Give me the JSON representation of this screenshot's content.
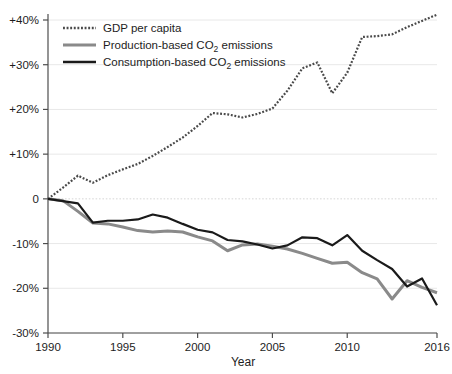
{
  "chart_data": {
    "type": "line",
    "title": "",
    "xlabel": "Year",
    "ylabel": "",
    "xlim": [
      1990,
      2016
    ],
    "ylim": [
      -30,
      40
    ],
    "grid": true,
    "grid_axis": "y",
    "legend_position": "top-left",
    "x": [
      1990,
      1991,
      1992,
      1993,
      1994,
      1995,
      1996,
      1997,
      1998,
      1999,
      2000,
      2001,
      2002,
      2003,
      2004,
      2005,
      2006,
      2007,
      2008,
      2009,
      2010,
      2011,
      2012,
      2013,
      2014,
      2015,
      2016
    ],
    "xticks": [
      1990,
      1995,
      2000,
      2005,
      2010,
      2016
    ],
    "xtick_labels": [
      "1990",
      "1995",
      "2000",
      "2005",
      "2010",
      "2016"
    ],
    "yticks": [
      40,
      30,
      20,
      10,
      0,
      -10,
      -20,
      -30
    ],
    "ytick_labels": [
      "+40%",
      "+30%",
      "+20%",
      "+10%",
      "0",
      "-10%",
      "-20%",
      "-30%"
    ],
    "series": [
      {
        "name": "GDP per capita",
        "key": "gdp",
        "color": "#4a4a4a",
        "style": "dotted",
        "width": 2.2,
        "values": [
          0.0,
          2.4,
          4.3,
          5.2,
          3.5,
          5.2,
          6.5,
          7.7,
          8.3,
          10.6,
          13.1,
          15.8,
          18.0,
          19.2,
          18.6,
          18.0,
          19.2,
          20.2,
          24.0,
          27.5,
          30.5,
          23.5,
          27.0,
          31.4,
          36.2,
          36.6,
          37.8
        ]
      },
      {
        "name": "Production-based CO2 emissions",
        "key": "production",
        "color": "#8a8a8a",
        "style": "solid",
        "width": 3.0,
        "values": [
          0.0,
          -0.3,
          -3.0,
          -5.3,
          -5.2,
          -5.6,
          -6.7,
          -7.3,
          -7.3,
          -5.9,
          -6.2,
          -7.6,
          -8.7,
          -9.9,
          -10.3,
          -11.6,
          -10.6,
          -11.0,
          -12.2,
          -13.5,
          -14.4,
          -13.1,
          -15.8,
          -16.5,
          -18.4,
          -22.5,
          -16.6
        ]
      },
      {
        "name": "Consumption-based CO2 emissions",
        "key": "consumption",
        "color": "#1a1a1a",
        "style": "solid",
        "width": 2.2,
        "values": [
          0.0,
          -0.4,
          -0.8,
          -5.3,
          -4.8,
          -4.8,
          -4.5,
          -3.4,
          -4.1,
          -4.2,
          -6.8,
          -6.4,
          -9.2,
          -9.5,
          -10.1,
          -10.6,
          -11.0,
          -10.2,
          -8.5,
          -8.6,
          -8.8,
          -10.3,
          -8.0,
          -11.5,
          -13.6,
          -15.6,
          -19.5
        ]
      }
    ],
    "series_values_extended": {
      "gdp": [
        0.0,
        2.4,
        4.3,
        5.2,
        3.5,
        5.2,
        6.5,
        7.7,
        8.3,
        10.6,
        13.1,
        15.8,
        18.0,
        19.2,
        18.6,
        18.0,
        19.2,
        20.2,
        24.0,
        27.5,
        30.5,
        23.5,
        27.0,
        31.4,
        36.2,
        36.6,
        37.8,
        39.4,
        41.2
      ],
      "production": [
        0.0,
        -0.3,
        -3.0,
        -5.3,
        -5.2,
        -5.6,
        -6.7,
        -7.3,
        -7.3,
        -7.2,
        -8.2,
        -9.4,
        -11.6,
        -10.3,
        -10.0,
        -10.6,
        -11.4,
        -12.2,
        -13.4,
        -14.4,
        -14.3,
        -16.4,
        -17.8,
        -22.5,
        -18.3,
        -19.8,
        -20.1,
        -22.2,
        -22.4,
        -21.2
      ],
      "consumption": [
        0.0,
        -0.4,
        -0.8,
        -5.3,
        -4.8,
        -4.8,
        -4.5,
        -3.4,
        -4.1,
        -5.6,
        -6.8,
        -7.5,
        -9.2,
        -9.5,
        -10.1,
        -11.1,
        -10.3,
        -8.5,
        -8.6,
        -8.8,
        -10.3,
        -8.0,
        -11.5,
        -13.6,
        -15.6,
        -19.5,
        -17.7,
        -15.5,
        -16.0,
        -20.2
      ]
    },
    "data_points": {
      "gdp": [
        {
          "year": 1990,
          "value": 0.0
        },
        {
          "year": 1991,
          "value": 2.5
        },
        {
          "year": 1992,
          "value": 5.2
        },
        {
          "year": 1993,
          "value": 3.6
        },
        {
          "year": 1994,
          "value": 5.3
        },
        {
          "year": 1995,
          "value": 6.6
        },
        {
          "year": 1996,
          "value": 7.8
        },
        {
          "year": 1997,
          "value": 9.6
        },
        {
          "year": 1998,
          "value": 11.6
        },
        {
          "year": 1999,
          "value": 13.7
        },
        {
          "year": 2000,
          "value": 16.3
        },
        {
          "year": 2001,
          "value": 19.2
        },
        {
          "year": 2002,
          "value": 18.9
        },
        {
          "year": 2003,
          "value": 18.2
        },
        {
          "year": 2004,
          "value": 19.0
        },
        {
          "year": 2005,
          "value": 20.2
        },
        {
          "year": 2006,
          "value": 24.2
        },
        {
          "year": 2007,
          "value": 29.2
        },
        {
          "year": 2008,
          "value": 30.5
        },
        {
          "year": 2009,
          "value": 23.6
        },
        {
          "year": 2010,
          "value": 28.2
        },
        {
          "year": 2011,
          "value": 36.2
        },
        {
          "year": 2012,
          "value": 36.4
        },
        {
          "year": 2013,
          "value": 36.8
        },
        {
          "year": 2014,
          "value": 38.4
        },
        {
          "year": 2015,
          "value": 39.8
        },
        {
          "year": 2016,
          "value": 41.2
        }
      ],
      "production": [
        {
          "year": 1990,
          "value": 0.0
        },
        {
          "year": 1991,
          "value": -0.4
        },
        {
          "year": 1992,
          "value": -2.8
        },
        {
          "year": 1993,
          "value": -5.4
        },
        {
          "year": 1994,
          "value": -5.6
        },
        {
          "year": 1995,
          "value": -6.3
        },
        {
          "year": 1996,
          "value": -7.1
        },
        {
          "year": 1997,
          "value": -7.4
        },
        {
          "year": 1998,
          "value": -7.2
        },
        {
          "year": 1999,
          "value": -7.4
        },
        {
          "year": 2000,
          "value": -8.5
        },
        {
          "year": 2001,
          "value": -9.4
        },
        {
          "year": 2002,
          "value": -11.6
        },
        {
          "year": 2003,
          "value": -10.3
        },
        {
          "year": 2004,
          "value": -10.1
        },
        {
          "year": 2005,
          "value": -10.6
        },
        {
          "year": 2006,
          "value": -11.2
        },
        {
          "year": 2007,
          "value": -12.2
        },
        {
          "year": 2008,
          "value": -13.3
        },
        {
          "year": 2009,
          "value": -14.4
        },
        {
          "year": 2010,
          "value": -14.2
        },
        {
          "year": 2011,
          "value": -16.5
        },
        {
          "year": 2012,
          "value": -17.9
        },
        {
          "year": 2013,
          "value": -22.4
        },
        {
          "year": 2014,
          "value": -18.3
        },
        {
          "year": 2015,
          "value": -19.8
        },
        {
          "year": 2016,
          "value": -21.0
        }
      ],
      "consumption": [
        {
          "year": 1990,
          "value": 0.0
        },
        {
          "year": 1991,
          "value": -0.5
        },
        {
          "year": 1992,
          "value": -1.0
        },
        {
          "year": 1993,
          "value": -5.3
        },
        {
          "year": 1994,
          "value": -4.9
        },
        {
          "year": 1995,
          "value": -4.9
        },
        {
          "year": 1996,
          "value": -4.6
        },
        {
          "year": 1997,
          "value": -3.5
        },
        {
          "year": 1998,
          "value": -4.2
        },
        {
          "year": 1999,
          "value": -5.6
        },
        {
          "year": 2000,
          "value": -6.9
        },
        {
          "year": 2001,
          "value": -7.5
        },
        {
          "year": 2002,
          "value": -9.2
        },
        {
          "year": 2003,
          "value": -9.5
        },
        {
          "year": 2004,
          "value": -10.2
        },
        {
          "year": 2005,
          "value": -11.1
        },
        {
          "year": 2006,
          "value": -10.4
        },
        {
          "year": 2007,
          "value": -8.6
        },
        {
          "year": 2008,
          "value": -8.8
        },
        {
          "year": 2009,
          "value": -10.4
        },
        {
          "year": 2010,
          "value": -8.1
        },
        {
          "year": 2011,
          "value": -11.6
        },
        {
          "year": 2012,
          "value": -13.7
        },
        {
          "year": 2013,
          "value": -15.7
        },
        {
          "year": 2014,
          "value": -19.6
        },
        {
          "year": 2015,
          "value": -17.8
        },
        {
          "year": 2016,
          "value": -23.8
        }
      ]
    }
  },
  "legend": {
    "entries": [
      {
        "label": "GDP per capita",
        "label_pre": "GDP per capita",
        "label_sub": "",
        "label_post": "",
        "color": "#4a4a4a",
        "style": "dotted"
      },
      {
        "label": "Production-based CO2 emissions",
        "label_pre": "Production-based CO",
        "label_sub": "2",
        "label_post": " emissions",
        "color": "#8a8a8a",
        "style": "solid"
      },
      {
        "label": "Consumption-based CO2 emissions",
        "label_pre": "Consumption-based CO",
        "label_sub": "2",
        "label_post": " emissions",
        "color": "#1a1a1a",
        "style": "solid"
      }
    ]
  },
  "axes": {
    "x_title": "Year",
    "y_title": "",
    "x_tick_labels": [
      "1990",
      "1995",
      "2000",
      "2005",
      "2010",
      "2016"
    ],
    "y_tick_labels": [
      "+40%",
      "+30%",
      "+20%",
      "+10%",
      "0",
      "-10%",
      "-20%",
      "-30%"
    ]
  },
  "colors": {
    "background": "#ffffff",
    "axis": "#4d4d4d",
    "grid": "#e8e8e8",
    "gdp": "#4a4a4a",
    "production": "#8a8a8a",
    "consumption": "#1a1a1a"
  }
}
